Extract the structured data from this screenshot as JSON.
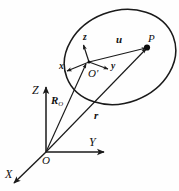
{
  "figure": {
    "background_color": "#fefefe",
    "stroke_color": "#1a1a1a",
    "label_color": "#111111"
  },
  "global_frame": {
    "origin_label": "O",
    "axes": [
      {
        "name": "x-axis",
        "label": "X"
      },
      {
        "name": "y-axis",
        "label": "Y"
      },
      {
        "name": "z-axis",
        "label": "Z"
      }
    ]
  },
  "local_frame": {
    "origin_label": "O'",
    "axes": [
      {
        "name": "x-axis-local",
        "label": "x"
      },
      {
        "name": "y-axis-local",
        "label": "y"
      },
      {
        "name": "z-axis-local",
        "label": "z"
      }
    ]
  },
  "points": [
    {
      "name": "point-p",
      "label": "P"
    }
  ],
  "vectors": [
    {
      "name": "vector-r0",
      "label": "R",
      "subscript": "O",
      "from": "O",
      "to": "O'"
    },
    {
      "name": "vector-r",
      "label": "r",
      "subscript": "",
      "from": "O",
      "to": "P"
    },
    {
      "name": "vector-u",
      "label": "u",
      "subscript": "",
      "from": "O'",
      "to": "P"
    }
  ],
  "body": {
    "name": "rigid-body-outline",
    "shape": "ellipse"
  }
}
